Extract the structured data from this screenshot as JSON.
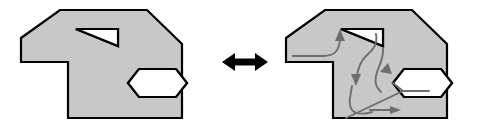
{
  "figure": {
    "name": "polygon-with-holes-equivalence-diagram",
    "background_color": "#ffffff",
    "width": 489,
    "height": 128,
    "outline_color": "#000000",
    "fill_color": "#c8c8c8",
    "hole_fill_color": "#ffffff",
    "cut_path_color": "#6e6e6e",
    "arrow_color": "#000000",
    "outline_width": 2.2,
    "cut_path_width": 1.9
  },
  "left_panel": {
    "name": "polygon-with-holes",
    "label": "",
    "polygon_points": "21,38 60,10 147,10 182,44 182,118 68,118 68,62 21,62",
    "holes": [
      {
        "name": "triangular-hole",
        "points": "76,29 118,29 118,46"
      },
      {
        "name": "hexagonal-hole",
        "points": "139,69 176,69 187,83 176,97 139,97 128,83"
      }
    ]
  },
  "connector": {
    "name": "double-headed-arrow",
    "label": "",
    "icon": "double-arrow-horizontal-icon",
    "left_tip_x": 222,
    "right_tip_x": 268,
    "center_y": 62
  },
  "right_panel": {
    "name": "polygon-with-cut-paths",
    "label": "",
    "polygon_points": "286,38 325,10 412,10 447,44 447,118 333,118 333,62 286,62",
    "holes": [
      {
        "name": "triangular-hole",
        "points": "341,29 383,29 383,46"
      },
      {
        "name": "hexagonal-hole",
        "points": "404,69 441,69 452,83 441,97 404,97 393,83"
      }
    ],
    "cut_paths": [
      {
        "name": "cut-path-triangle-to-boundary",
        "d": "M 293,56 L 323,56 C 337,56 339,48 340,40",
        "arrow_head": "up-left-arrowhead",
        "head_points": "340,29 335,41 345,41"
      },
      {
        "name": "cut-path-triangle-to-notch",
        "d": "M 376,34 C 378,46 372,50 366,56 C 360,62 358,68 357,76",
        "arrow_head": "down-arrowhead",
        "head_points": "356,86 351,74 361,74"
      },
      {
        "name": "cut-path-notch-to-hexagon",
        "d": "M 383,48 C 384,60 378,66 376,76 C 374,86 378,88 381,92",
        "arrow_head": "up-arrowhead",
        "head_points": "388,63 380,72 392,74"
      },
      {
        "name": "cut-path-lower-loop",
        "d": "M 352,86 C 350,98 348,104 352,110 C 356,115 366,114 372,112",
        "arrow_head": "",
        "head_points": ""
      },
      {
        "name": "cut-path-hexagon-to-bottom-edge",
        "d": "M 393,83 L 403,91 L 346,118",
        "arrow_head": "",
        "head_points": ""
      },
      {
        "name": "cut-path-bottom-right-arrow",
        "d": "M 370,110 L 393,110",
        "arrow_head": "right-arrowhead",
        "head_points": "401,110 390,106 390,114"
      },
      {
        "name": "cut-path-hexagon-right-stub",
        "d": "M 403,91 L 429,91",
        "arrow_head": "",
        "head_points": ""
      }
    ]
  }
}
